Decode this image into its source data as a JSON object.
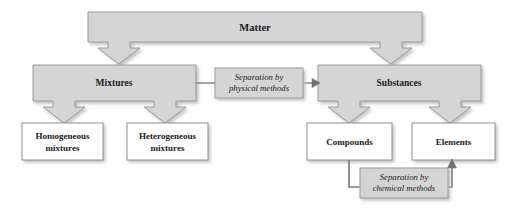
{
  "diagram": {
    "colors": {
      "node_fill_shaded": "#d5d5d5",
      "node_fill_plain": "#ffffff",
      "node_stroke": "#9a9a9a",
      "arrow_fill": "#d5d5d5",
      "arrow_stroke": "#8d8d8d",
      "connector_stroke": "#7d7d7d",
      "label_fill": "#d5d5d5",
      "text_color": "#1a1a1a",
      "shadow_color": "#c9c9c9",
      "background": "#ffffff"
    },
    "nodes": [
      {
        "id": "matter",
        "label": "Matter",
        "level": 1,
        "style": "shaded"
      },
      {
        "id": "mixtures",
        "label": "Mixtures",
        "level": 2,
        "style": "shaded"
      },
      {
        "id": "substances",
        "label": "Substances",
        "level": 2,
        "style": "shaded"
      },
      {
        "id": "homogeneous",
        "label": "Homogeneous",
        "label2": "mixtures",
        "level": 3,
        "style": "plain"
      },
      {
        "id": "heterogeneous",
        "label": "Heterogeneous",
        "label2": "mixtures",
        "level": 3,
        "style": "plain"
      },
      {
        "id": "compounds",
        "label": "Compounds",
        "level": 3,
        "style": "plain"
      },
      {
        "id": "elements",
        "label": "Elements",
        "level": 3,
        "style": "plain"
      }
    ],
    "connector_labels": [
      {
        "id": "physical",
        "line1": "Separation by",
        "line2": "physical methods",
        "from": "mixtures",
        "to": "substances"
      },
      {
        "id": "chemical",
        "line1": "Separation by",
        "line2": "chemical methods",
        "from": "compounds",
        "to": "elements"
      }
    ],
    "arrows": [
      {
        "id": "matter-to-mixtures",
        "from": "matter",
        "to": "mixtures",
        "direction": "down"
      },
      {
        "id": "matter-to-substances",
        "from": "matter",
        "to": "substances",
        "direction": "down"
      },
      {
        "id": "mixtures-to-homogeneous",
        "from": "mixtures",
        "to": "homogeneous",
        "direction": "down"
      },
      {
        "id": "mixtures-to-heterogeneous",
        "from": "mixtures",
        "to": "heterogeneous",
        "direction": "down"
      },
      {
        "id": "substances-to-compounds",
        "from": "substances",
        "to": "compounds",
        "direction": "down"
      },
      {
        "id": "substances-to-elements",
        "from": "substances",
        "to": "elements",
        "direction": "down"
      },
      {
        "id": "mixtures-to-substances",
        "from": "mixtures",
        "to": "substances",
        "direction": "right"
      },
      {
        "id": "compounds-to-elements",
        "from": "compounds",
        "to": "elements",
        "direction": "up"
      }
    ]
  }
}
